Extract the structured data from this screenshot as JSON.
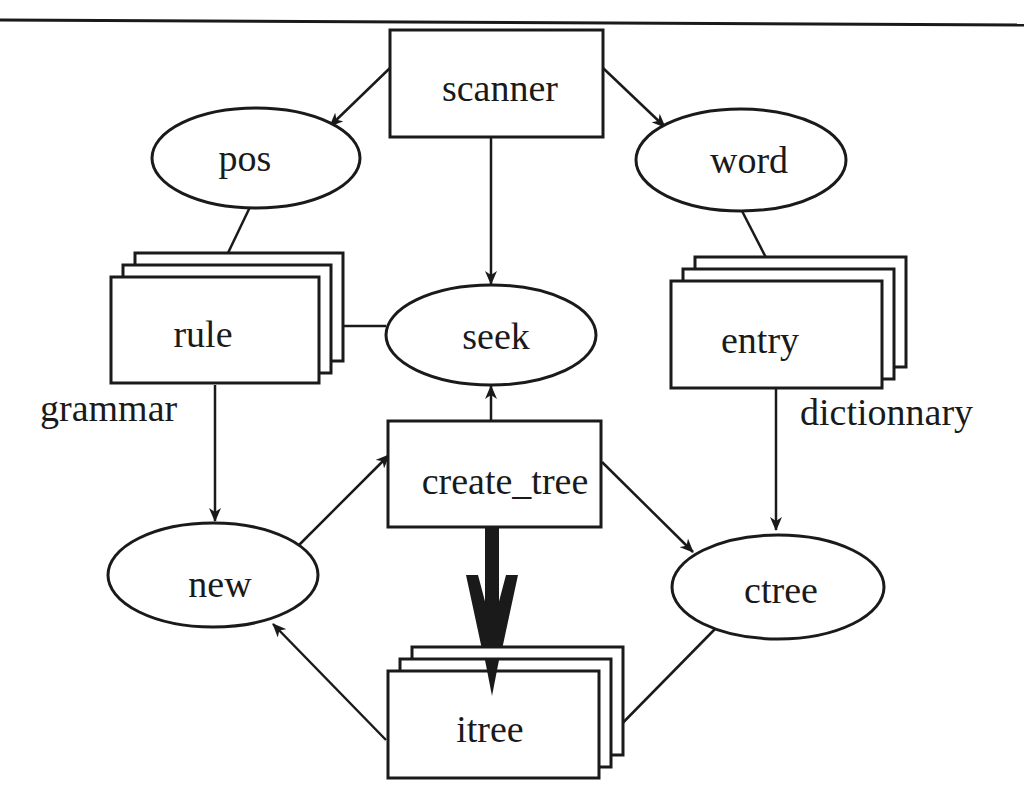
{
  "diagram": {
    "nodes": {
      "scanner": {
        "label": "scanner",
        "shape": "rectangle"
      },
      "pos": {
        "label": "pos",
        "shape": "ellipse"
      },
      "word": {
        "label": "word",
        "shape": "ellipse"
      },
      "rule": {
        "label": "rule",
        "shape": "stacked-rectangle"
      },
      "seek": {
        "label": "seek",
        "shape": "ellipse"
      },
      "entry": {
        "label": "entry",
        "shape": "stacked-rectangle"
      },
      "create_tree": {
        "label": "create_tree",
        "shape": "rectangle"
      },
      "new": {
        "label": "new",
        "shape": "ellipse"
      },
      "ctree": {
        "label": "ctree",
        "shape": "ellipse"
      },
      "itree": {
        "label": "itree",
        "shape": "stacked-rectangle"
      }
    },
    "annotations": {
      "grammar": "grammar",
      "dictionnary": "dictionnary"
    },
    "edges": [
      {
        "from": "scanner",
        "to": "pos"
      },
      {
        "from": "scanner",
        "to": "word"
      },
      {
        "from": "scanner",
        "to": "seek"
      },
      {
        "from": "pos",
        "to": "rule"
      },
      {
        "from": "word",
        "to": "entry"
      },
      {
        "from": "seek",
        "to": "rule"
      },
      {
        "from": "rule",
        "to": "new"
      },
      {
        "from": "entry",
        "to": "ctree"
      },
      {
        "from": "create_tree",
        "to": "seek"
      },
      {
        "from": "new",
        "to": "create_tree"
      },
      {
        "from": "create_tree",
        "to": "ctree"
      },
      {
        "from": "create_tree",
        "to": "itree",
        "style": "bold"
      },
      {
        "from": "itree",
        "to": "new"
      },
      {
        "from": "ctree",
        "to": "itree"
      }
    ]
  }
}
